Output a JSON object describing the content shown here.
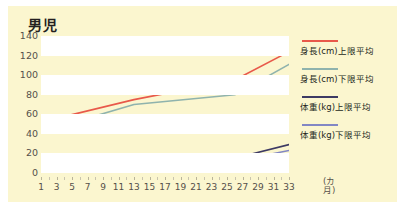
{
  "chart_data": {
    "type": "line",
    "title": "男児",
    "xlabel": "カ月",
    "ylabel": "",
    "xlim": [
      1,
      33
    ],
    "ylim": [
      0,
      140
    ],
    "grid": "horizontal-bands",
    "legend_position": "right",
    "xticks": [
      "1",
      "3",
      "5",
      "7",
      "9",
      "11",
      "13",
      "15",
      "17",
      "19",
      "21",
      "23",
      "25",
      "27",
      "29",
      "31",
      "33"
    ],
    "yticks": [
      "0",
      "20",
      "40",
      "60",
      "80",
      "100",
      "120",
      "140"
    ],
    "x": [
      1,
      13,
      26,
      33
    ],
    "series": [
      {
        "name": "身長(cm)上限平均",
        "color": "#e8594a",
        "values": [
          52,
          75,
          95,
          124
        ]
      },
      {
        "name": "身長(cm)下限平均",
        "color": "#8fb3ad",
        "values": [
          42,
          70,
          80,
          111
        ]
      },
      {
        "name": "体重(kg)上限平均",
        "color": "#3d3a63",
        "values": [
          9,
          12,
          15,
          29
        ]
      },
      {
        "name": "体重(kg)下限平均",
        "color": "#8287c4",
        "values": [
          8,
          10,
          12,
          23
        ]
      }
    ]
  },
  "chart": {
    "title": "男児",
    "unit_label": "(カ月)"
  },
  "colors": {
    "card_background": "#fbf6cf",
    "band": "#ffffff",
    "tick_text": "#55504a",
    "title_text": "#231f20"
  }
}
